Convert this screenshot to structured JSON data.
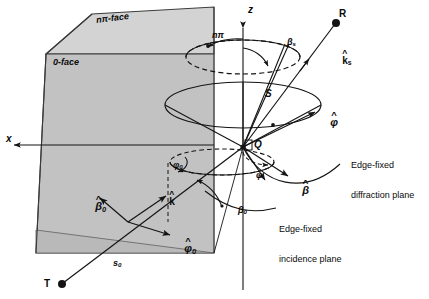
{
  "figure": {
    "type": "wedge-diffraction-geometry-diagram",
    "background_color": "#ffffff",
    "line_color": "#141414",
    "face_fill_0": "#c4c4c4",
    "face_fill_npi": "#d5d5d5"
  },
  "faces": {
    "npi_face_label": "nπ-face",
    "zero_face_label": "0-face"
  },
  "axes": {
    "z_label": "z",
    "x_label": "x"
  },
  "points": {
    "origin_label": "Q",
    "source_label": "T",
    "receiver_label": "R",
    "cone_label": "S"
  },
  "vectors": {
    "k_s": "k",
    "k_s_sub": "s",
    "k_inc": "k",
    "phi_hat": "φ",
    "beta_hat": "β",
    "beta_hat_0": "β",
    "beta_hat_0_sub": "0",
    "phi_hat_0": "φ",
    "phi_hat_0_sub": "0",
    "s_0": "s",
    "s_0_sub": "0"
  },
  "angles": {
    "beta_s": "β",
    "beta_s_sub": "s",
    "beta_0": "β",
    "beta_0_sub": "0",
    "phi": "φ",
    "phi_0": "φ",
    "phi_0_sub": "0",
    "npi_arc": "nπ"
  },
  "callouts": {
    "diffraction_plane_line1": "Edge-fixed",
    "diffraction_plane_line2": "diffraction plane",
    "incidence_plane_line1": "Edge-fixed",
    "incidence_plane_line2": "incidence plane"
  }
}
